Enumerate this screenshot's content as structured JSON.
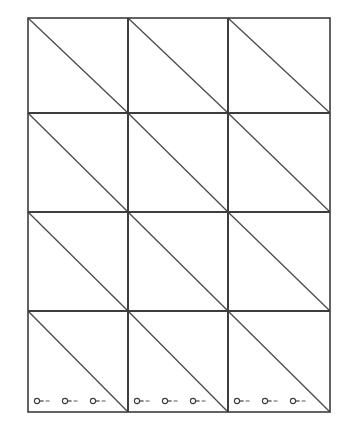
{
  "figure": {
    "title": "",
    "background_color": "#ffffff",
    "line_color": "#3d3d3d",
    "diagonal_color": "#4a4a4a",
    "marker_color": "#3d3d3d",
    "panel": {
      "x": 28,
      "y": 18,
      "width": 302,
      "height": 394,
      "columns": 3,
      "rows": 4
    },
    "column_edges": [
      28,
      128,
      228,
      330
    ],
    "row_edges": [
      18,
      113,
      212,
      311,
      412
    ],
    "cells": [
      {
        "row": 0,
        "col": 0,
        "diagonal": "top-left-to-bottom-right",
        "markers": 0
      },
      {
        "row": 0,
        "col": 1,
        "diagonal": "top-left-to-bottom-right",
        "markers": 0
      },
      {
        "row": 0,
        "col": 2,
        "diagonal": "top-left-to-bottom-right",
        "markers": 0
      },
      {
        "row": 1,
        "col": 0,
        "diagonal": "top-left-to-bottom-right",
        "markers": 0
      },
      {
        "row": 1,
        "col": 1,
        "diagonal": "top-left-to-bottom-right",
        "markers": 0
      },
      {
        "row": 1,
        "col": 2,
        "diagonal": "top-left-to-bottom-right",
        "markers": 0
      },
      {
        "row": 2,
        "col": 0,
        "diagonal": "top-left-to-bottom-right",
        "markers": 0
      },
      {
        "row": 2,
        "col": 1,
        "diagonal": "top-left-to-bottom-right",
        "markers": 0
      },
      {
        "row": 2,
        "col": 2,
        "diagonal": "top-left-to-bottom-right",
        "markers": 0
      },
      {
        "row": 3,
        "col": 0,
        "diagonal": "top-left-to-bottom-right",
        "markers": 3
      },
      {
        "row": 3,
        "col": 1,
        "diagonal": "top-left-to-bottom-right",
        "markers": 3
      },
      {
        "row": 3,
        "col": 2,
        "diagonal": "top-left-to-bottom-right",
        "markers": 3
      }
    ],
    "marker": {
      "icon": "circle-dash-marker-icon",
      "ring_radius": 2.6,
      "stem_length": 4,
      "dash_length": 4,
      "dash_gap": 2,
      "baseline_y": 401
    },
    "marker_positions": [
      {
        "cell_row": 3,
        "cell_col": 0,
        "x": 37,
        "y": 401
      },
      {
        "cell_row": 3,
        "cell_col": 0,
        "x": 65,
        "y": 401
      },
      {
        "cell_row": 3,
        "cell_col": 0,
        "x": 93,
        "y": 401
      },
      {
        "cell_row": 3,
        "cell_col": 1,
        "x": 137,
        "y": 401
      },
      {
        "cell_row": 3,
        "cell_col": 1,
        "x": 165,
        "y": 401
      },
      {
        "cell_row": 3,
        "cell_col": 1,
        "x": 193,
        "y": 401
      },
      {
        "cell_row": 3,
        "cell_col": 2,
        "x": 237,
        "y": 401
      },
      {
        "cell_row": 3,
        "cell_col": 2,
        "x": 265,
        "y": 401
      },
      {
        "cell_row": 3,
        "cell_col": 2,
        "x": 293,
        "y": 401
      }
    ]
  }
}
